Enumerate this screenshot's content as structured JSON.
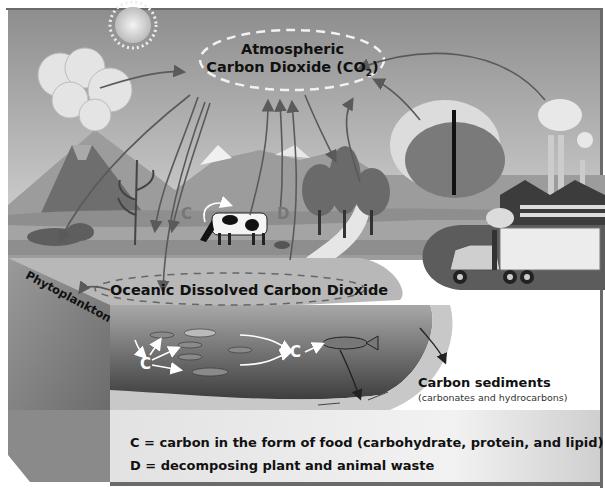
{
  "diagram": {
    "labels": {
      "atmospheric_line1": "Atmospheric",
      "atmospheric_line2": "Carbon Dioxide (CO",
      "atmospheric_sub": "2",
      "atmospheric_close": ")",
      "oceanic": "Oceanic Dissolved Carbon Dioxide",
      "phytoplankton": "Phytoplankton",
      "sediments_title": "Carbon sediments",
      "sediments_sub": "(carbonates and hydrocarbons)",
      "marker_c": "C",
      "marker_d": "D"
    },
    "legend": [
      "C = carbon in the form of food (carbohydrate, protein, and lipid)",
      "D = decomposing plant and animal waste"
    ],
    "elements": [
      "sun",
      "volcano",
      "clouds",
      "mountains",
      "corn-plant",
      "cow",
      "trees",
      "forest-fire",
      "factory",
      "smokestacks",
      "truck",
      "river",
      "ocean",
      "fish",
      "fish-skeletons",
      "sediment-layer"
    ],
    "colors": {
      "sky_top": "#8a8a8a",
      "sky_bottom": "#d8d8d8",
      "ground": "#9a9a9a",
      "ground_dark": "#6e6e6e",
      "water_surface": "#c4c4c4",
      "water_deep": "#4a4a4a",
      "sediment": "#c8c8c8",
      "panel": "#e6e6e6",
      "border": "#6a6a6a",
      "arrow": "#5a5a5a"
    }
  }
}
